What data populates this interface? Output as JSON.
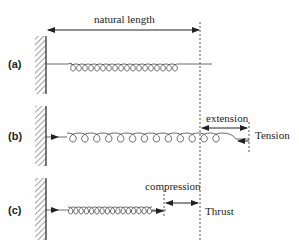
{
  "labels": {
    "natural_length": "natural length",
    "extension": "extension",
    "tension": "Tension",
    "compression": "compression",
    "thrust": "Thrust"
  },
  "parts": [
    "(a)",
    "(b)",
    "(c)"
  ],
  "colors": {
    "line": "#333333",
    "dashed": "#555555"
  }
}
